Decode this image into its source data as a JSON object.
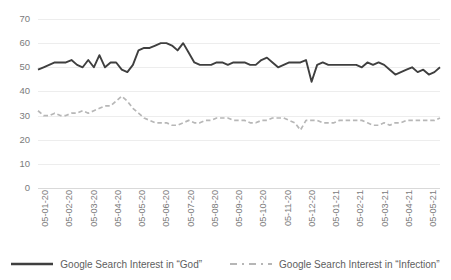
{
  "chart_data": {
    "type": "line",
    "title": "",
    "subtitle": "",
    "xlabel": "",
    "ylabel": "",
    "ylim": [
      0,
      70
    ],
    "ytick_step": 10,
    "yticks": [
      "70",
      "60",
      "50",
      "40",
      "30",
      "20",
      "10",
      "0"
    ],
    "grid": true,
    "grid_axis": "y",
    "legend_position": "bottom",
    "xticks": [
      "05-01-20",
      "05-02-20",
      "05-03-20",
      "05-04-20",
      "05-05-20",
      "05-06-20",
      "05-07-20",
      "05-08-20",
      "05-09-20",
      "05-10-20",
      "05-11-20",
      "05-12-20",
      "05-01-21",
      "05-02-21",
      "05-03-21",
      "05-04-21",
      "05-05-21"
    ],
    "series": [
      {
        "name": "Google Search Interest in “God”",
        "style": "solid",
        "color": "#3f3f3f",
        "values": [
          49,
          50,
          51,
          52,
          52,
          52,
          53,
          51,
          50,
          53,
          50,
          55,
          50,
          52,
          52,
          49,
          48,
          51,
          57,
          58,
          58,
          59,
          60,
          60,
          59,
          57,
          60,
          56,
          52,
          51,
          51,
          51,
          52,
          52,
          51,
          52,
          52,
          52,
          51,
          51,
          53,
          54,
          52,
          50,
          51,
          52,
          52,
          52,
          53,
          44,
          51,
          52,
          51,
          51,
          51,
          51,
          51,
          51,
          50,
          52,
          51,
          52,
          51,
          49,
          47,
          48,
          49,
          50,
          48,
          49,
          47,
          48,
          50
        ]
      },
      {
        "name": "Google Search Interest in “Infection”",
        "style": "dashed",
        "color": "#b7b7b7",
        "values": [
          32,
          30,
          30,
          31,
          30,
          30,
          31,
          31,
          32,
          31,
          32,
          33,
          34,
          34,
          36,
          38,
          36,
          33,
          31,
          29,
          28,
          27,
          27,
          27,
          26,
          26,
          27,
          28,
          27,
          27,
          28,
          28,
          29,
          29,
          29,
          28,
          28,
          28,
          27,
          27,
          28,
          28,
          29,
          29,
          29,
          28,
          27,
          24,
          28,
          28,
          28,
          27,
          27,
          27,
          28,
          28,
          28,
          28,
          28,
          27,
          26,
          26,
          27,
          26,
          27,
          27,
          28,
          28,
          28,
          28,
          28,
          28,
          29
        ]
      }
    ]
  },
  "legend": {
    "items": [
      {
        "label": "Google Search Interest in “God”",
        "style": "solid"
      },
      {
        "label": "Google Search Interest in “Infection”",
        "style": "dashed"
      }
    ]
  },
  "colors": {
    "god_line": "#3f3f3f",
    "infection_line": "#b7b7b7",
    "gridline": "#ededed",
    "tick_text": "#7b7b7b",
    "legend_text": "#5e5e5e",
    "background": "#ffffff"
  }
}
